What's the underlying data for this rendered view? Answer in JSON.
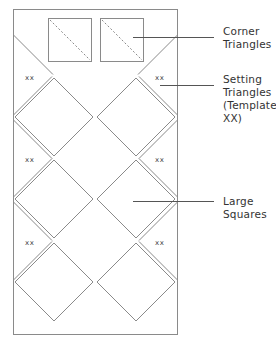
{
  "diagram": {
    "colors": {
      "line": "#8a8a8a",
      "dashed": "#8a8a8a",
      "text": "#333333"
    },
    "block_marker": "xx",
    "callouts": [
      {
        "id": "corner-triangles",
        "text": "Corner\nTriangles"
      },
      {
        "id": "setting-triangles",
        "text": "Setting\nTriangles\n(Template\nXX)"
      },
      {
        "id": "large-squares",
        "text": "Large\nSquares"
      }
    ],
    "markers": [
      {
        "text": "xx"
      },
      {
        "text": "xx"
      },
      {
        "text": "xx"
      },
      {
        "text": "xx"
      },
      {
        "text": "xx"
      },
      {
        "text": "xx"
      }
    ],
    "layout": {
      "columns": 2,
      "rows": 3,
      "corner_squares": 2
    }
  }
}
